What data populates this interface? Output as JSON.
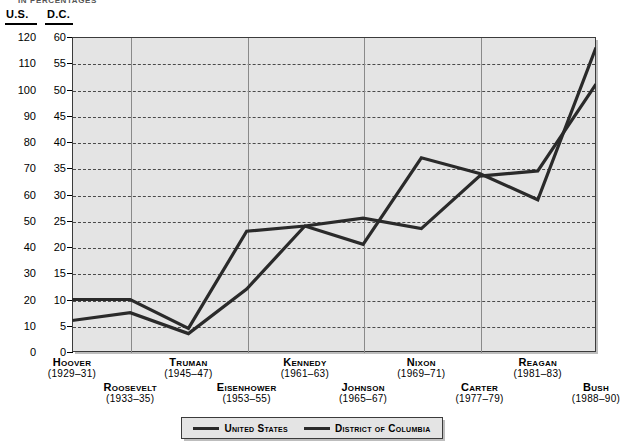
{
  "caption": "IN PERCENTAGES",
  "axis_headers": {
    "left": "U.S.",
    "right": "D.C."
  },
  "legend": {
    "items": [
      {
        "label": "United States",
        "color": "#2a2a2a"
      },
      {
        "label": "District of Columbia",
        "color": "#2a2a2a"
      }
    ]
  },
  "chart_data": {
    "type": "line",
    "title": "IN PERCENTAGES",
    "xlabel": "",
    "ylabel": "",
    "grid": true,
    "legend_position": "bottom",
    "categories": [
      "Hoover (1929-31)",
      "Roosevelt (1933-35)",
      "Truman (1945-47)",
      "Eisenhower (1953-55)",
      "Kennedy (1961-63)",
      "Johnson (1965-67)",
      "Nixon (1969-71)",
      "Carter (1977-79)",
      "Reagan (1981-83)",
      "Bush (1988-90)"
    ],
    "axes": [
      {
        "name": "U.S.",
        "side": "left",
        "ylim": [
          0,
          120
        ],
        "ticks": [
          0,
          10,
          20,
          30,
          40,
          50,
          60,
          70,
          80,
          90,
          100,
          110,
          120
        ]
      },
      {
        "name": "D.C.",
        "side": "right",
        "ylim": [
          0,
          60
        ],
        "ticks": [
          0,
          5,
          10,
          15,
          20,
          25,
          30,
          35,
          40,
          45,
          50,
          55,
          60
        ]
      }
    ],
    "series": [
      {
        "name": "United States",
        "axis": "U.S.",
        "color": "#2a2a2a",
        "values": [
          20,
          20,
          9,
          46,
          48,
          51,
          47,
          67,
          69,
          102
        ]
      },
      {
        "name": "District of Columbia",
        "axis": "D.C.",
        "color": "#2a2a2a",
        "values": [
          6,
          7.5,
          3.5,
          12,
          24,
          20.5,
          37,
          34,
          29,
          58
        ]
      }
    ]
  },
  "x_labels": [
    {
      "name": "Hoover",
      "years": "(1929–31)",
      "row": 0
    },
    {
      "name": "Roosevelt",
      "years": "(1933–35)",
      "row": 1
    },
    {
      "name": "Truman",
      "years": "(1945–47)",
      "row": 0
    },
    {
      "name": "Eisenhower",
      "years": "(1953–55)",
      "row": 1
    },
    {
      "name": "Kennedy",
      "years": "(1961–63)",
      "row": 0
    },
    {
      "name": "Johnson",
      "years": "(1965–67)",
      "row": 1
    },
    {
      "name": "Nixon",
      "years": "(1969–71)",
      "row": 0
    },
    {
      "name": "Carter",
      "years": "(1977–79)",
      "row": 1
    },
    {
      "name": "Reagan",
      "years": "(1981–83)",
      "row": 0
    },
    {
      "name": "Bush",
      "years": "(1988–90)",
      "row": 1
    }
  ]
}
